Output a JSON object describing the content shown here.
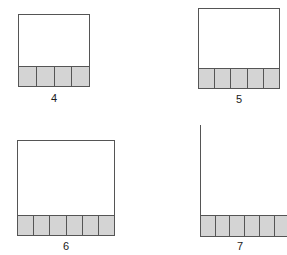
{
  "canvas": {
    "width": 287,
    "height": 255,
    "background": "#ffffff"
  },
  "style": {
    "square_fill": "#ffffff",
    "square_border": "#555555",
    "cell_fill": "#d4d4d4",
    "cell_border": "#555555",
    "caption_color": "#1a1a1a"
  },
  "figures": [
    {
      "label": "4",
      "shaded_cells": 4,
      "clipped": false
    },
    {
      "label": "5",
      "shaded_cells": 5,
      "clipped": false
    },
    {
      "label": "6",
      "shaded_cells": 6,
      "clipped": false
    },
    {
      "label": "7",
      "shaded_cells": 7,
      "clipped": true
    }
  ]
}
